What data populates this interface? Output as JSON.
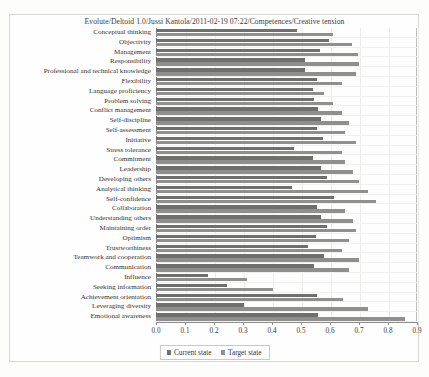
{
  "title": "Evolute/Deltoid 1.0/Jussi Kantola/2011-02-19 07:22/Competences/Creative tension",
  "legend": {
    "current_label": "Current state",
    "target_label": "Target state",
    "current_color": "#6f6f6e",
    "target_color": "#8f8f8e"
  },
  "axis": {
    "ticks": [
      "0.0",
      "0.1",
      "0.2",
      "0.3",
      "0.4",
      "0.5",
      "0.6",
      "0.7",
      "0.8",
      "0.9"
    ]
  },
  "chart_data": {
    "type": "bar",
    "orientation": "horizontal",
    "title": "Evolute/Deltoid 1.0/Jussi Kantola/2011-02-19 07:22/Competences/Creative tension",
    "xlabel": "",
    "ylabel": "",
    "xlim": [
      0.0,
      0.9
    ],
    "grid": true,
    "legend_position": "bottom-center",
    "categories": [
      "Conceptual thinking",
      "Objectivity",
      "Management",
      "Responsibility",
      "Professional and technical knowledge",
      "Flexibility",
      "Language proficiency",
      "Problem solving",
      "Conflict management",
      "Self-discipline",
      "Self-assessment",
      "Initiative",
      "Stress tolerance",
      "Commitment",
      "Leadership",
      "Developing others",
      "Analytical thinking",
      "Self-confidence",
      "Collaboration",
      "Understanding others",
      "Maintaining order",
      "Optimism",
      "Trustworthiness",
      "Teamwork and cooperation",
      "Communication",
      "Influence",
      "Seeking information",
      "Achievement orientation",
      "Leveraging diversity",
      "Emotional awareness"
    ],
    "series": [
      {
        "name": "Current state",
        "values": [
          0.485,
          0.595,
          0.565,
          0.515,
          0.515,
          0.555,
          0.54,
          0.545,
          0.56,
          0.57,
          0.555,
          0.575,
          0.475,
          0.54,
          0.57,
          0.59,
          0.47,
          0.615,
          0.555,
          0.57,
          0.59,
          0.55,
          0.525,
          0.58,
          0.545,
          0.18,
          0.245,
          0.555,
          0.305,
          0.56
        ]
      },
      {
        "name": "Target state",
        "values": [
          0.61,
          0.675,
          0.695,
          0.7,
          0.69,
          0.64,
          0.58,
          0.61,
          0.64,
          0.665,
          0.65,
          0.69,
          0.64,
          0.65,
          0.68,
          0.7,
          0.73,
          0.76,
          0.65,
          0.68,
          0.69,
          0.665,
          0.64,
          0.7,
          0.665,
          0.315,
          0.405,
          0.645,
          0.73,
          0.86
        ]
      }
    ]
  }
}
